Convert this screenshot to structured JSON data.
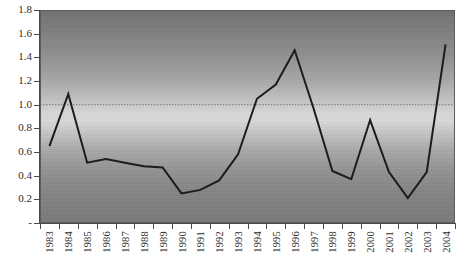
{
  "chart_data": {
    "type": "line",
    "title": "",
    "subtitle": "",
    "xlabel": "",
    "ylabel": "",
    "categories": [
      "1983",
      "1984",
      "1985",
      "1986",
      "1987",
      "1988",
      "1989",
      "1990",
      "1991",
      "1992",
      "1993",
      "1994",
      "1995",
      "1996",
      "1997",
      "1998",
      "1999",
      "2000",
      "2001",
      "2002",
      "2003",
      "2004"
    ],
    "values": [
      0.65,
      1.09,
      0.51,
      0.54,
      0.51,
      0.48,
      0.47,
      0.25,
      0.28,
      0.36,
      0.58,
      1.05,
      1.17,
      1.46,
      0.97,
      0.44,
      0.37,
      0.87,
      0.43,
      0.21,
      0.43,
      1.51
    ],
    "series": [
      {
        "name": "series-1",
        "values": [
          0.65,
          1.09,
          0.51,
          0.54,
          0.51,
          0.48,
          0.47,
          0.25,
          0.28,
          0.36,
          0.58,
          1.05,
          1.17,
          1.46,
          0.97,
          0.44,
          0.37,
          0.87,
          0.43,
          0.21,
          0.43,
          1.51
        ],
        "color": "#1c1c1c"
      }
    ],
    "ylim": [
      0,
      1.8
    ],
    "yticks": [
      "-",
      "0.2",
      "0.4",
      "0.6",
      "0.8",
      "1.0",
      "1.2",
      "1.4",
      "1.6",
      "1.8"
    ],
    "ytick_values": [
      0,
      0.2,
      0.4,
      0.6,
      0.8,
      1.0,
      1.2,
      1.4,
      1.6,
      1.8
    ],
    "grid": false,
    "legend": "none",
    "reference_line": {
      "value": 1.0,
      "style": "dotted",
      "color": "#777777"
    },
    "plot_background": {
      "style": "vertical-gradient",
      "top_color": "#6f6f6f",
      "mid_color": "#dadada",
      "bottom_color": "#7a7a7a"
    },
    "axis_color": "#4a4a4a",
    "line_color": "#1c1c1c",
    "line_width": 2
  }
}
